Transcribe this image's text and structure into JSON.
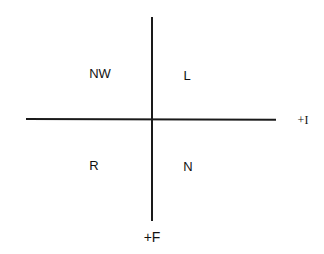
{
  "diagram": {
    "quadrants": {
      "top_left": "NW",
      "top_right": "L",
      "bottom_left": "R",
      "bottom_right": "N"
    },
    "axes": {
      "horizontal_label": "+I",
      "vertical_label": "+F"
    }
  }
}
